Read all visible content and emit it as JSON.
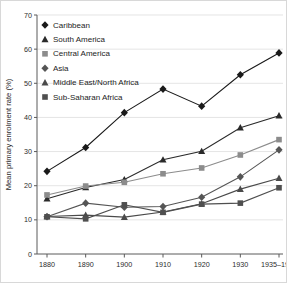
{
  "chart_data": {
    "type": "line",
    "title": "",
    "xlabel": "",
    "ylabel": "Mean primary enrolment rate (%)",
    "categories": [
      "1880",
      "1890",
      "1900",
      "1910",
      "1920",
      "1930",
      "1935–1940"
    ],
    "ylim": [
      0,
      70
    ],
    "yticks": [
      0,
      10,
      20,
      30,
      40,
      50,
      60,
      70
    ],
    "grid": true,
    "legend_position": "top-left",
    "series": [
      {
        "name": "Caribbean",
        "marker": "diamond",
        "color": "#1a1a1a",
        "values": [
          24.2,
          31.2,
          41.4,
          48.3,
          43.3,
          52.5,
          58.9
        ]
      },
      {
        "name": "South America",
        "marker": "triangle",
        "color": "#2a2a2a",
        "values": [
          16.2,
          19.5,
          21.8,
          27.6,
          30.1,
          37.0,
          40.5
        ]
      },
      {
        "name": "Central America",
        "marker": "square",
        "color": "#8c8c8c",
        "values": [
          17.3,
          19.9,
          21.0,
          23.5,
          25.2,
          29.0,
          33.5
        ]
      },
      {
        "name": "Asia",
        "marker": "diamond",
        "color": "#555555",
        "values": [
          10.9,
          14.9,
          13.7,
          13.9,
          16.6,
          22.6,
          30.5
        ]
      },
      {
        "name": "Middle East/North Africa",
        "marker": "triangle",
        "color": "#4a4a4a",
        "values": [
          11.0,
          11.4,
          10.8,
          12.3,
          14.7,
          19.0,
          22.2
        ]
      },
      {
        "name": "Sub-Saharan Africa",
        "marker": "square",
        "color": "#4f4f4f",
        "values": [
          10.9,
          10.3,
          14.4,
          12.2,
          14.6,
          14.9,
          19.4
        ]
      }
    ]
  },
  "legend": {
    "items": [
      "Caribbean",
      "South America",
      "Central America",
      "Asia",
      "Middle East/North Africa",
      "Sub-Saharan Africa"
    ]
  }
}
